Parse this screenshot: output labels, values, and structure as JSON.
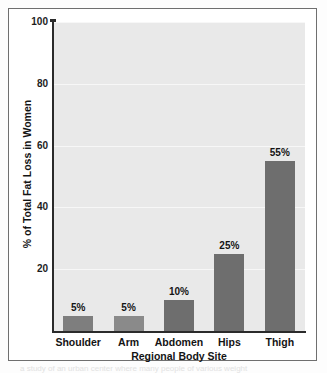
{
  "figure": {
    "background_color": "#ffffff",
    "border_color": "#6f6f6f",
    "plot_background_color": "#e9e9e9",
    "gridline_color": "#f7f7f7",
    "axis_color": "#2b2b2b"
  },
  "chart_data": {
    "type": "bar",
    "title": "",
    "xlabel": "Regional Body Site",
    "ylabel": "% of Total Fat Loss in Women",
    "categories": [
      "Shoulder",
      "Arm",
      "Abdomen",
      "Hips",
      "Thigh"
    ],
    "values": [
      5,
      5,
      10,
      25,
      55
    ],
    "data_labels": [
      "5%",
      "5%",
      "10%",
      "25%",
      "55%"
    ],
    "bar_colors": [
      "#7e7e7e",
      "#8a8a8a",
      "#6e6e6e",
      "#6e6e6e",
      "#6e6e6e"
    ],
    "ylim": [
      0,
      100
    ],
    "yticks": [
      100,
      80,
      60,
      40,
      20
    ],
    "ytick_labels": [
      "100",
      "80",
      "60",
      "40",
      "20"
    ],
    "grid": true,
    "grid_axis": "y",
    "legend": null,
    "legend_position": "none"
  },
  "caption_bleed": "a study of an urban center where many people of various weight"
}
